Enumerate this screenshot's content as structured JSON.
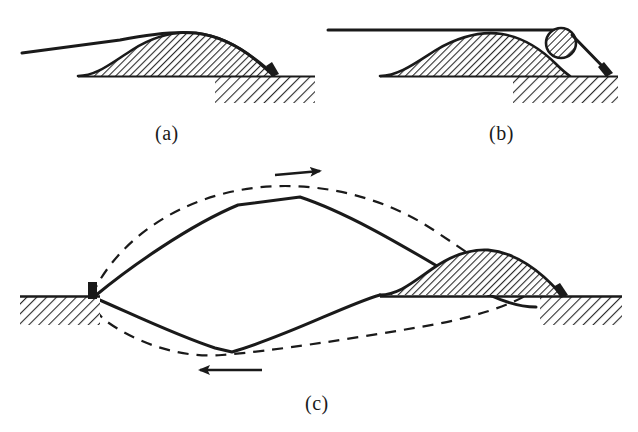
{
  "figure": {
    "background_color": "#ffffff",
    "ink_color": "#1a1a1a",
    "hatch_color": "#2b2b2b",
    "width": 638,
    "height": 432,
    "panels": [
      {
        "id": "a",
        "caption": "(a)",
        "caption_x": 155,
        "caption_y": 122,
        "description": "taut straight line tangent over hatched mound, anchored at step peg",
        "elements": [
          "tangent-line",
          "hatched-mound",
          "ground-baseline",
          "ground-block",
          "anchor-peg"
        ]
      },
      {
        "id": "b",
        "caption": "(b)",
        "caption_x": 489,
        "caption_y": 122,
        "description": "horizontal line with hatched roller circle wedged against mound slope, line down to anchor peg",
        "elements": [
          "horizontal-line",
          "roller-circle",
          "hatched-mound",
          "ground-baseline",
          "ground-block",
          "anchor-peg",
          "tether-line"
        ]
      },
      {
        "id": "c",
        "caption": "(c)",
        "caption_x": 305,
        "caption_y": 392,
        "description": "closed loop between two anchor pegs: solid polygonal path inside dashed smooth curve, circulation arrows, mound at right",
        "elements": [
          "dashed-loop-curve",
          "solid-polygon-path",
          "upper-vertex",
          "lower-vertex",
          "arrow-right-top",
          "arrow-left-bottom",
          "left-ground-block",
          "left-anchor-peg",
          "hatched-mound",
          "right-ground-block",
          "right-anchor-peg"
        ]
      }
    ],
    "arrows": [
      {
        "name": "top-arrow",
        "direction": "right",
        "label": ""
      },
      {
        "name": "bottom-arrow",
        "direction": "left",
        "label": ""
      }
    ]
  }
}
